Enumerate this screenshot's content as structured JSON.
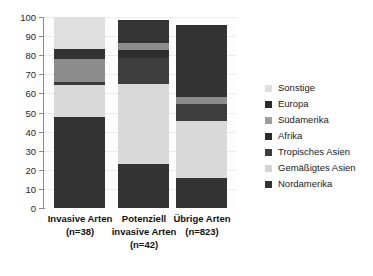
{
  "chart_data": {
    "type": "bar",
    "stacked": true,
    "title": "",
    "xlabel": "",
    "ylabel": "",
    "ylim": [
      0,
      100
    ],
    "yticks": [
      0,
      10,
      20,
      30,
      40,
      50,
      60,
      70,
      80,
      90,
      100
    ],
    "grid": true,
    "legend_position": "right",
    "categories": [
      "Invasive Arten (n=38)",
      "Potenziell invasive Arten (n=42)",
      "Übrige Arten (n=823)"
    ],
    "category_lines": [
      [
        "Invasive Arten",
        "(n=38)"
      ],
      [
        "Potenziell",
        "invasive Arten",
        "(n=42)"
      ],
      [
        "Übrige Arten",
        "(n=823)"
      ]
    ],
    "series": [
      {
        "name": "Nordamerika",
        "color": "#333333",
        "values": [
          47.5,
          23.0,
          15.5
        ]
      },
      {
        "name": "Gemäßigtes Asien",
        "color": "#d9d9d9",
        "values": [
          17.0,
          42.0,
          30.0
        ]
      },
      {
        "name": "Tropisches Asien",
        "color": "#3a3a3a",
        "values": [
          1.5,
          13.5,
          9.0
        ]
      },
      {
        "name": "Afrika",
        "color": "#8c8c8c",
        "values": [
          12.0,
          4.0,
          3.5
        ]
      },
      {
        "name": "Südamerika",
        "color": "#333333",
        "values": [
          5.0,
          4.0,
          38.0
        ]
      },
      {
        "name": "Europa",
        "color": "#2e2e2e",
        "values": [
          0.0,
          12.0,
          0.0
        ]
      },
      {
        "name": "Sonstige",
        "color": "#e0e0e0",
        "values": [
          17.0,
          1.5,
          4.0
        ]
      }
    ],
    "legend": [
      {
        "label": "Sonstige",
        "color": "#e0e0e0"
      },
      {
        "label": "Europa",
        "color": "#2b2b2b"
      },
      {
        "label": "Südamerika",
        "color": "#9e9e9e"
      },
      {
        "label": "Afrika",
        "color": "#2b2b2b"
      },
      {
        "label": "Tropisches Asien",
        "color": "#3d3d3d"
      },
      {
        "label": "Gemäßigtes Asien",
        "color": "#d4d4d4"
      },
      {
        "label": "Nordamerika",
        "color": "#333333"
      }
    ],
    "bars": [
      {
        "name": "Invasive Arten",
        "segments": [
          {
            "series": "Nordamerika",
            "from": 0,
            "to": 47.5,
            "color": "#333333"
          },
          {
            "series": "Gemäßigtes Asien",
            "from": 47.5,
            "to": 64.5,
            "color": "#d9d9d9"
          },
          {
            "series": "Tropisches Asien",
            "from": 64.5,
            "to": 66.0,
            "color": "#3a3a3a"
          },
          {
            "series": "Afrika",
            "from": 66.0,
            "to": 78.0,
            "color": "#8c8c8c"
          },
          {
            "series": "Südamerika",
            "from": 78.0,
            "to": 83.0,
            "color": "#333333"
          },
          {
            "series": "Sonstige",
            "from": 83.0,
            "to": 100.0,
            "color": "#e0e0e0"
          }
        ]
      },
      {
        "name": "Potenziell invasive Arten",
        "segments": [
          {
            "series": "Nordamerika",
            "from": 0,
            "to": 23.0,
            "color": "#333333"
          },
          {
            "series": "Gemäßigtes Asien",
            "from": 23.0,
            "to": 65.0,
            "color": "#d9d9d9"
          },
          {
            "series": "Tropisches Asien",
            "from": 65.0,
            "to": 78.5,
            "color": "#3d3d3d"
          },
          {
            "series": "Südamerika",
            "from": 78.5,
            "to": 82.5,
            "color": "#2e2e2e"
          },
          {
            "series": "Afrika",
            "from": 82.5,
            "to": 86.5,
            "color": "#8c8c8c"
          },
          {
            "series": "Europa",
            "from": 86.5,
            "to": 98.5,
            "color": "#343434"
          }
        ]
      },
      {
        "name": "Übrige Arten",
        "segments": [
          {
            "series": "Nordamerika",
            "from": 0,
            "to": 15.5,
            "color": "#333333"
          },
          {
            "series": "Gemäßigtes Asien",
            "from": 15.5,
            "to": 45.5,
            "color": "#d9d9d9"
          },
          {
            "series": "Tropisches Asien",
            "from": 45.5,
            "to": 54.5,
            "color": "#3d3d3d"
          },
          {
            "series": "Afrika",
            "from": 54.5,
            "to": 58.0,
            "color": "#8c8c8c"
          },
          {
            "series": "Südamerika",
            "from": 58.0,
            "to": 96.0,
            "color": "#333333"
          }
        ]
      }
    ]
  }
}
